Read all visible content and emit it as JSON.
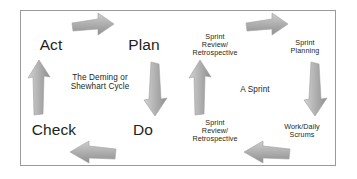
{
  "figure": {
    "border_color": "#9a9a9a",
    "background_color": "#ffffff",
    "text_color": "#231f20",
    "arrow_color": "#a6a6a6",
    "arrow_color_dark": "#8f8f8f"
  },
  "left_cycle": {
    "center_label": "The Deming or\nShewhart Cycle",
    "nodes": [
      {
        "id": "act",
        "label": "Act"
      },
      {
        "id": "plan",
        "label": "Plan"
      },
      {
        "id": "do",
        "label": "Do"
      },
      {
        "id": "check",
        "label": "Check"
      }
    ],
    "arrows": [
      {
        "id": "act-to-plan",
        "direction": "right"
      },
      {
        "id": "plan-to-do",
        "direction": "down"
      },
      {
        "id": "do-to-check",
        "direction": "left"
      },
      {
        "id": "check-to-act",
        "direction": "up"
      }
    ]
  },
  "right_cycle": {
    "center_label": "A Sprint",
    "nodes": [
      {
        "id": "sprint-review-retrospective-top",
        "label": "Sprint\nReview/\nRetrospective"
      },
      {
        "id": "sprint-planning",
        "label": "Sprint\nPlanning"
      },
      {
        "id": "work-daily-scrums",
        "label": "Work/Daily\nScrums"
      },
      {
        "id": "sprint-review-retrospective-bottom",
        "label": "Sprint\nReview/\nRetrospective"
      }
    ],
    "arrows": [
      {
        "id": "review-to-planning",
        "direction": "right"
      },
      {
        "id": "planning-to-work",
        "direction": "down"
      },
      {
        "id": "work-to-review",
        "direction": "left"
      },
      {
        "id": "review-to-sprint",
        "direction": "up"
      }
    ]
  }
}
